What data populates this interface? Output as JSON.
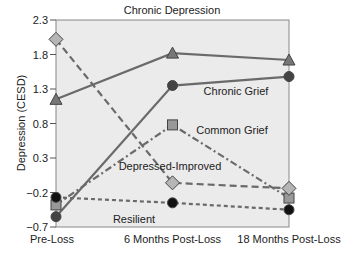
{
  "chart_data": {
    "type": "line",
    "title": "",
    "xlabel": "",
    "ylabel": "Depression (CESD)",
    "ylim": [
      -0.7,
      2.3
    ],
    "yticks": [
      2.3,
      1.8,
      1.3,
      0.8,
      0.3,
      -0.2,
      -0.7
    ],
    "ytick_labels": [
      "2.3",
      "1.8",
      "1.3",
      "0.8",
      "0.3",
      "−0.2",
      "−0.7"
    ],
    "categories": [
      "Pre-Loss",
      "6 Months Post-Loss",
      "18 Months Post-Loss"
    ],
    "grid": false,
    "legend": "inline labels",
    "series": [
      {
        "name": "Chronic Depression",
        "values": [
          1.15,
          1.82,
          1.72
        ],
        "marker": "triangle",
        "line": "solid",
        "marker_color": "#777777"
      },
      {
        "name": "Chronic Grief",
        "values": [
          -0.55,
          1.35,
          1.48
        ],
        "marker": "circle",
        "line": "solid",
        "marker_color": "#444444"
      },
      {
        "name": "Common Grief",
        "values": [
          -0.38,
          0.78,
          -0.28
        ],
        "marker": "square",
        "line": "dash-dot",
        "marker_color": "#999999"
      },
      {
        "name": "Depressed-Improved",
        "values": [
          2.02,
          -0.06,
          -0.14
        ],
        "marker": "diamond",
        "line": "dashed",
        "marker_color": "#b5b5b5"
      },
      {
        "name": "Resilient",
        "values": [
          -0.27,
          -0.35,
          -0.45
        ],
        "marker": "circle",
        "line": "dotted",
        "marker_color": "#111111"
      }
    ],
    "label_positions": {
      "Chronic Depression": [
        172,
        14
      ],
      "Chronic Grief": [
        236,
        95
      ],
      "Common Grief": [
        232,
        134
      ],
      "Depressed-Improved": [
        170,
        170
      ],
      "Resilient": [
        134,
        223
      ]
    }
  },
  "colors": {
    "plot_background": "#ebebeb",
    "line": "#6a6a6a",
    "axis": "#888888"
  }
}
